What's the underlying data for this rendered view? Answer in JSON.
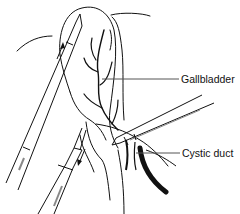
{
  "figure": {
    "labels": [
      {
        "id": "gallbladder",
        "text": "Gallbladder"
      },
      {
        "id": "cystic_duct",
        "text": "Cystic duct"
      }
    ],
    "instruments": [
      {
        "id": "grasper-upper",
        "direction": "upward push arrow"
      },
      {
        "id": "grasper-lower",
        "direction": "downward pull arrow"
      },
      {
        "id": "dissector-right",
        "direction": "from right"
      }
    ],
    "colors": {
      "line": "#111111",
      "background": "#ffffff",
      "leader": "#555555"
    }
  }
}
